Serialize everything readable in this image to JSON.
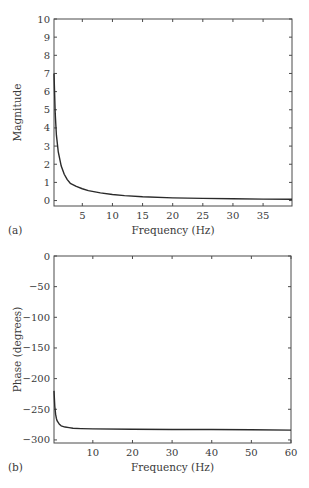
{
  "chart_data": [
    {
      "type": "line",
      "panel_label": "(a)",
      "title": "",
      "xlabel": "Frequency (Hz)",
      "ylabel": "Magnitude",
      "xlim": [
        0.3,
        39.8
      ],
      "ylim": [
        -0.3,
        10
      ],
      "xticks": [
        5,
        10,
        15,
        20,
        25,
        30,
        35
      ],
      "yticks": [
        0,
        1,
        2,
        3,
        4,
        5,
        6,
        7,
        8,
        9,
        10
      ],
      "grid": false,
      "legend": null,
      "series": [
        {
          "name": "Magnitude",
          "x": [
            0.3,
            0.5,
            0.7,
            1.0,
            1.5,
            2.0,
            2.5,
            3.0,
            4.0,
            5.0,
            6.0,
            8.0,
            10.0,
            12.0,
            15.0,
            20.0,
            25.0,
            30.0,
            35.0,
            39.8
          ],
          "y": [
            7.0,
            4.8,
            3.6,
            2.7,
            1.9,
            1.45,
            1.15,
            0.95,
            0.78,
            0.65,
            0.55,
            0.42,
            0.33,
            0.27,
            0.21,
            0.15,
            0.12,
            0.1,
            0.08,
            0.07
          ]
        }
      ]
    },
    {
      "type": "line",
      "panel_label": "(b)",
      "title": "",
      "xlabel": "Frequency (Hz)",
      "ylabel": "Phase (degrees)",
      "xlim": [
        0.2,
        60
      ],
      "ylim": [
        -305,
        0
      ],
      "xticks": [
        10,
        20,
        30,
        40,
        50,
        60
      ],
      "yticks": [
        0,
        -50,
        -100,
        -150,
        -200,
        -250,
        -300
      ],
      "grid": false,
      "legend": null,
      "series": [
        {
          "name": "Phase",
          "x": [
            0.2,
            0.4,
            0.6,
            0.8,
            1.0,
            1.5,
            2.0,
            3.0,
            4.0,
            5.0,
            7.0,
            10.0,
            20.0,
            30.0,
            40.0,
            50.0,
            60.0
          ],
          "y": [
            -220,
            -245,
            -258,
            -265,
            -269,
            -274,
            -277,
            -279,
            -280,
            -281,
            -281.5,
            -282,
            -282.5,
            -283,
            -283,
            -283.5,
            -284
          ]
        }
      ]
    }
  ]
}
